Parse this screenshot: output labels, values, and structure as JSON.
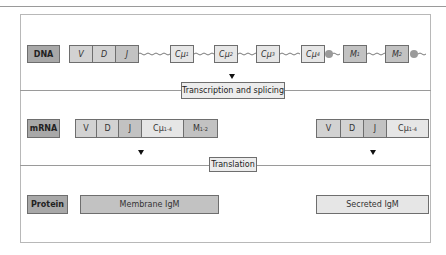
{
  "rows": {
    "dna": {
      "label": "DNA",
      "segments": [
        {
          "text": "V"
        },
        {
          "text": "D"
        },
        {
          "text": "J"
        },
        {
          "text": "Cμ",
          "sub": "1"
        },
        {
          "text": "Cμ",
          "sub": "2"
        },
        {
          "text": "Cμ",
          "sub": "3"
        },
        {
          "text": "Cμ",
          "sub": "4"
        },
        {
          "text": "M",
          "sub": "1"
        },
        {
          "text": "M",
          "sub": "2"
        }
      ]
    },
    "mrna": {
      "label": "mRNA",
      "membrane": [
        {
          "text": "V"
        },
        {
          "text": "D"
        },
        {
          "text": "J"
        },
        {
          "text": "Cμ",
          "sub": "1-4"
        },
        {
          "text": "M",
          "sub": "1-2"
        }
      ],
      "secreted": [
        {
          "text": "V"
        },
        {
          "text": "D"
        },
        {
          "text": "J"
        },
        {
          "text": "Cμ",
          "sub": "1-4"
        }
      ]
    },
    "protein": {
      "label": "Protein",
      "membrane": "Membrane IgM",
      "secreted": "Secreted IgM"
    }
  },
  "steps": {
    "transcription": "Transcription and splicing",
    "translation": "Translation"
  }
}
